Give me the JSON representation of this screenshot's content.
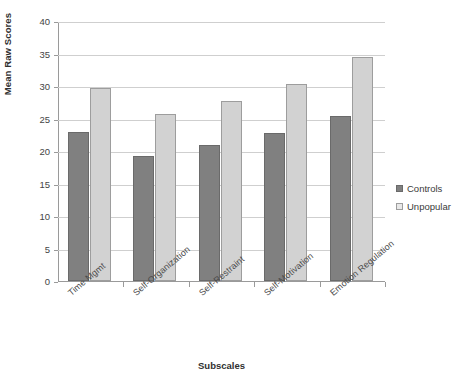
{
  "chart_data": {
    "type": "bar",
    "title": "",
    "xlabel": "Subscales",
    "ylabel": "Mean Raw Scores",
    "ylim": [
      0,
      40
    ],
    "ytick_step": 5,
    "yticks": [
      "0",
      "5",
      "10",
      "15",
      "20",
      "25",
      "30",
      "35",
      "40"
    ],
    "grid": true,
    "legend_position": "right",
    "categories": [
      "Time Mgmt",
      "Self-Organization",
      "Self-Restraint",
      "Self-Motivation",
      "Emotion Regulation"
    ],
    "series": [
      {
        "name": "Controls",
        "color": "#808080",
        "values": [
          23.0,
          19.3,
          20.9,
          22.8,
          25.4
        ]
      },
      {
        "name": "Unpopular",
        "color": "#d2d2d2",
        "values": [
          29.7,
          25.7,
          27.7,
          30.3,
          34.4
        ]
      }
    ]
  },
  "legend": {
    "items": [
      {
        "label": "Controls",
        "swatch": "controls-swatch-icon"
      },
      {
        "label": "Unpopular",
        "swatch": "unpopular-swatch-icon"
      }
    ]
  }
}
